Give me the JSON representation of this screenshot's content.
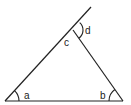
{
  "diagram": {
    "type": "triangle-with-exterior-angle",
    "stroke_color": "#222222",
    "background": "#ffffff",
    "labels": {
      "a": "a",
      "b": "b",
      "c": "c",
      "d": "d"
    }
  }
}
